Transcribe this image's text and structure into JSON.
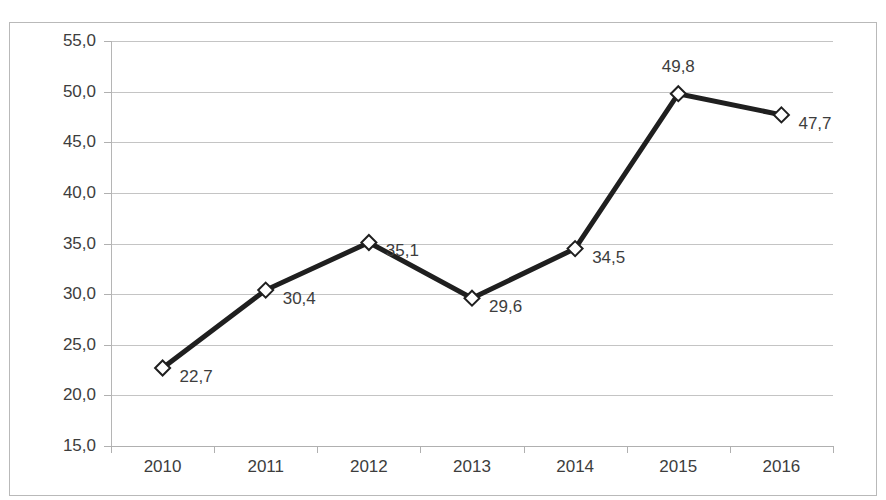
{
  "chart_data": {
    "type": "line",
    "title": "",
    "xlabel": "",
    "ylabel": "",
    "categories": [
      "2010",
      "2011",
      "2012",
      "2013",
      "2014",
      "2015",
      "2016"
    ],
    "values": [
      22.7,
      30.4,
      35.1,
      29.6,
      34.5,
      49.8,
      47.7
    ],
    "value_labels": [
      "22,7",
      "30,4",
      "35,1",
      "29,6",
      "34,5",
      "49,8",
      "47,7"
    ],
    "label_positions": [
      "right",
      "right",
      "right",
      "right",
      "right",
      "above",
      "right"
    ],
    "ylim": [
      15.0,
      55.0
    ],
    "ytick_step": 5.0,
    "ytick_labels": [
      "55,0",
      "50,0",
      "45,0",
      "40,0",
      "35,0",
      "30,0",
      "25,0",
      "20,0",
      "15,0"
    ],
    "ytick_values": [
      55.0,
      50.0,
      45.0,
      40.0,
      35.0,
      30.0,
      25.0,
      20.0,
      15.0
    ],
    "grid": true,
    "legend": "none",
    "decimal_separator": ",",
    "marker": "diamond",
    "colors": {
      "line": "#1f1f1f",
      "marker_fill": "#ffffff",
      "marker_stroke": "#1f1f1f",
      "gridline": "#c4c4c4",
      "axis": "#b0b0b0",
      "border": "#b9b9b9",
      "text": "#3d3d3d",
      "background": "#ffffff"
    }
  },
  "chart": {
    "title_fragment": ""
  }
}
